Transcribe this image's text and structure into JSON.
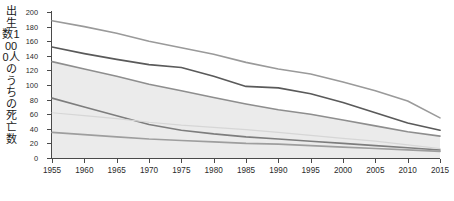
{
  "chart_data": {
    "type": "line",
    "title": "",
    "xlabel": "",
    "ylabel": "出生数1000人のうちの死亡数",
    "x": [
      1955,
      1960,
      1965,
      1970,
      1975,
      1980,
      1985,
      1990,
      1995,
      2000,
      2005,
      2010,
      2015
    ],
    "xlim": [
      1955,
      2015
    ],
    "ylim": [
      0,
      200
    ],
    "ytick_values": [
      0,
      20,
      40,
      60,
      80,
      100,
      120,
      140,
      160,
      180,
      200
    ],
    "xtick_labels": [
      "1955",
      "1960",
      "1965",
      "1970",
      "1975",
      "1980",
      "1985",
      "1990",
      "1995",
      "2000",
      "2005",
      "2010",
      "2015"
    ],
    "grid": false,
    "legend": "none",
    "shaded_band": {
      "name": "shaded-range-band",
      "color": "#ebebeb",
      "upper": [
        132,
        122,
        112,
        101,
        92,
        83,
        74,
        66,
        60,
        52,
        44,
        36,
        30
      ],
      "lower": [
        0,
        0,
        0,
        0,
        0,
        0,
        0,
        0,
        0,
        0,
        0,
        0,
        0
      ]
    },
    "series": [
      {
        "name": "series-1",
        "color": "#9a9a9a",
        "width": 1.6,
        "values": [
          188,
          180,
          171,
          160,
          151,
          142,
          131,
          122,
          115,
          104,
          92,
          78,
          55
        ]
      },
      {
        "name": "series-2",
        "color": "#5a5a5a",
        "width": 1.7,
        "values": [
          152,
          143,
          135,
          128,
          124,
          112,
          98,
          96,
          88,
          76,
          62,
          48,
          38
        ]
      },
      {
        "name": "series-3",
        "color": "#8e8e8e",
        "width": 1.6,
        "values": [
          132,
          122,
          112,
          101,
          92,
          83,
          74,
          66,
          60,
          52,
          44,
          36,
          30
        ]
      },
      {
        "name": "series-4",
        "color": "#7d7d7d",
        "width": 1.6,
        "values": [
          82,
          70,
          58,
          46,
          38,
          33,
          29,
          26,
          23,
          20,
          17,
          14,
          11
        ]
      },
      {
        "name": "series-5",
        "color": "#d6d6d6",
        "width": 1.2,
        "values": [
          62,
          58,
          54,
          49,
          45,
          42,
          39,
          35,
          31,
          27,
          23,
          18,
          13
        ]
      },
      {
        "name": "series-6",
        "color": "#9e9e9e",
        "width": 1.7,
        "values": [
          35,
          32,
          29,
          26,
          24,
          22,
          20,
          19,
          17,
          15,
          13,
          11,
          9
        ]
      }
    ]
  },
  "axis": {
    "y_title_text": "出生数1000人のうちの死亡数",
    "y_axis_color": "#4a4a4a",
    "x_axis_color": "#4a4a4a"
  }
}
